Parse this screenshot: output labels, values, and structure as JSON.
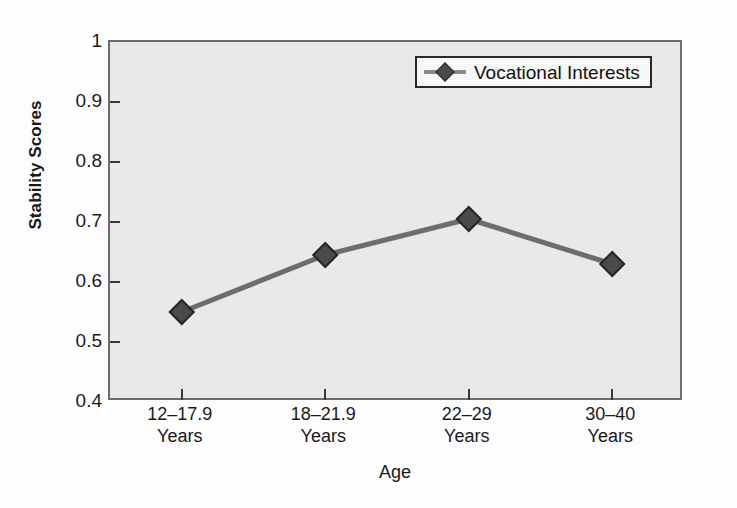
{
  "chart_data": {
    "type": "line",
    "title": "",
    "xlabel": "Age",
    "ylabel": "Stability Scores",
    "categories": [
      "12–17.9 Years",
      "18–21.9 Years",
      "22–29 Years",
      "30–40 Years"
    ],
    "category_lines": [
      {
        "line1": "12–17.9",
        "line2": "Years"
      },
      {
        "line1": "18–21.9",
        "line2": "Years"
      },
      {
        "line1": "22–29",
        "line2": "Years"
      },
      {
        "line1": "30–40",
        "line2": "Years"
      }
    ],
    "series": [
      {
        "name": "Vocational Interests",
        "values": [
          0.55,
          0.645,
          0.705,
          0.63
        ],
        "marker": "diamond",
        "line_color": "#6d6d6d",
        "marker_color": "#4a4a4a"
      }
    ],
    "ylim": [
      0.4,
      1.0
    ],
    "yticks": [
      0.4,
      0.5,
      0.6,
      0.7,
      0.8,
      0.9,
      1.0
    ],
    "ytick_labels": [
      "0.4",
      "0.5",
      "0.6",
      "0.7",
      "0.8",
      "0.9",
      "1"
    ],
    "grid": false,
    "legend_position": "top-right",
    "legend_entries": [
      "Vocational Interests"
    ],
    "plot_background": "#e9e9e9",
    "figure_background": "#fdfdfd",
    "axis_color": "#6d6d6d"
  },
  "legend": {
    "label": "Vocational Interests"
  },
  "axes": {
    "y_title": "Stability Scores",
    "x_title": "Age"
  }
}
